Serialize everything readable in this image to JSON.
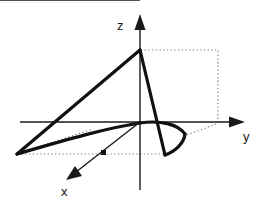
{
  "figure": {
    "background_color": "#ffffff",
    "width": 261,
    "height": 203,
    "line_color": "#111111",
    "guide_color": "#7a7a7a"
  },
  "axes": [
    {
      "id": "z-axis",
      "label": "z",
      "label_x": 117,
      "label_y": 30,
      "direction": "up",
      "line": {
        "x1": 140,
        "y1": 190,
        "x2": 140,
        "y2": 24
      },
      "arrow_points": "140,14 134.5,30 145.5,30"
    },
    {
      "id": "y-axis",
      "label": "y",
      "label_x": 243,
      "label_y": 141,
      "direction": "right",
      "line": {
        "x1": 20,
        "y1": 122,
        "x2": 234,
        "y2": 122
      },
      "arrow_points": "245,122 229,116.5 229,127.5"
    },
    {
      "id": "x-axis",
      "label": "x",
      "label_x": 61,
      "label_y": 196,
      "direction": "down-left",
      "line": {
        "x1": 140,
        "y1": 122,
        "x2": 76,
        "y2": 172
      },
      "arrow_points": "66,180 82,176 75,166"
    }
  ],
  "origin": {
    "x": 140,
    "y": 122,
    "marker_x": 103,
    "marker_y": 152,
    "marker_size": 4
  },
  "curves": [
    {
      "id": "left-edge-to-apex",
      "description": "straight thick line from left vertex up to apex on z-axis",
      "path": "M 17,154 L 140,50"
    },
    {
      "id": "apex-to-lower-vertex",
      "description": "straight thick line from apex down to lower front vertex",
      "path": "M 140,50 L 165,155"
    },
    {
      "id": "left-vertex-to-curve-loop",
      "description": "thick curved edge from left vertex sweeping right through near-origin",
      "path": "M 17,154 C 62,141 106,128 140,123 C 160,120 178,124 185,134"
    },
    {
      "id": "loop-closing-arc",
      "description": "thick arc closing the conic section from lower vertex to the right bulge",
      "path": "M 165,155 C 176,151 184,143 185,134"
    }
  ],
  "guides": [
    {
      "id": "apex-horizontal-guide",
      "path": "M 141,50 L 219,50"
    },
    {
      "id": "right-vertical-guide",
      "path": "M 218,51 L 218,122"
    },
    {
      "id": "base-horizontal-guide",
      "path": "M 18,154 L 166,154"
    },
    {
      "id": "right-diagonal-guide",
      "path": "M 216,124 L 184,136"
    },
    {
      "id": "left-diagonal-guide",
      "path": "M 19,153 L 93,129"
    }
  ],
  "labels": {
    "x": "x",
    "y": "y",
    "z": "z"
  }
}
